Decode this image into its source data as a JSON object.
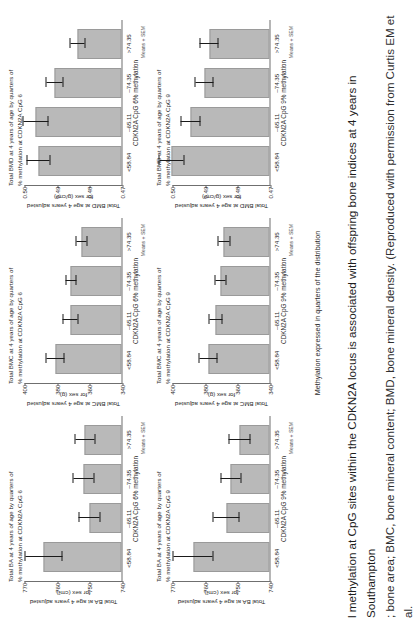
{
  "figure": {
    "common_x_axis_label": "Methylation expressed in quarters of the distribution",
    "caption_line1": "l methylation at CpG sites within the CDKN2A locus is associated with offspring bone indices at 4 years in Southampton",
    "caption_line2": "; bone area; BMC, bone mineral content; BMD, bone mineral density. (Reproduced with permission from Curtis EM et al."
  },
  "categories": [
    "<58.84",
    "–65.11",
    "–74.35",
    ">74.35"
  ],
  "series_note": "Means + SEM",
  "chart_data": [
    {
      "id": "ba-cpg6",
      "type": "bar",
      "title": "Total BA at 4 years of age by quarters of % methylation at CDKN2A CpG 6",
      "title_line1": "Total BA at 4 years of age by quarters of",
      "title_line2": "% methylation at CDKN2A CpG 6",
      "ylabel": "Total BA at age 4 years adjusted for sex (cm²)",
      "ylabel_line1": "Total BA at age 4 years adjusted",
      "ylabel_line2": "for sex (cm²)",
      "xlabel": "CDKN2A CpG 6% methylation",
      "categories": [
        "<58.84",
        "–65.11",
        "–74.35",
        ">74.35"
      ],
      "values": [
        763.8,
        749.9,
        751.6,
        751.2
      ],
      "errors": [
        5.6,
        3.2,
        3.1,
        3.0
      ],
      "ylim": [
        740,
        770
      ],
      "yticks": [
        740,
        750,
        760,
        770
      ],
      "ytick_labels": [
        "740",
        "750",
        "760",
        "770"
      ],
      "grid": false
    },
    {
      "id": "bmc-cpg6",
      "type": "bar",
      "title": "Total BMC at 4 years of age by quarters of % methylation at CDKN2A CpG 6",
      "title_line1": "Total BMC at 4 years of age by quarters of",
      "title_line2": "% methylation at CDKN2A CpG 6",
      "ylabel": "Total BMC at age 4 years adjusted for sex (g)",
      "ylabel_line1": "Total BMC at age 4 years adjusted",
      "ylabel_line2": "for sex (g)",
      "xlabel": "CDKN2A CpG 6% methylation",
      "categories": [
        "<58.84",
        "–65.11",
        "–74.35",
        ">74.35"
      ],
      "values": [
        380.5,
        371.5,
        371.0,
        364.5
      ],
      "errors": [
        5.5,
        4.5,
        3.2,
        3.2
      ],
      "ylim": [
        340,
        400
      ],
      "yticks": [
        340,
        360,
        380,
        400
      ],
      "ytick_labels": [
        "340",
        "360",
        "380",
        "400"
      ],
      "grid": false
    },
    {
      "id": "bmd-cpg6",
      "type": "bar",
      "title": "Total BMD at 4 years of age by quarters of % methylation at CDKN2A CpG 6",
      "title_line1": "Total BMD at 4 years of age by quarters of",
      "title_line2": "% methylation at CDKN2A CpG 6",
      "ylabel": "Total BMD at age 4 years adjusted for sex (g/cm²)",
      "ylabel_line1": "Total BMD at age 4 years adjusted",
      "ylabel_line2": "for sex (g/cm²)",
      "xlabel": "CDKN2A CpG 6% methylation",
      "categories": [
        "<58.84",
        "–65.11",
        "–74.35",
        ">74.35"
      ],
      "values": [
        0.4955,
        0.4962,
        0.4905,
        0.4835
      ],
      "errors": [
        0.0035,
        0.0038,
        0.0025,
        0.0022
      ],
      "ylim": [
        0.47,
        0.5
      ],
      "yticks": [
        0.47,
        0.48,
        0.49,
        0.5
      ],
      "ytick_labels": [
        "0.47",
        "0.48",
        "0.49",
        "0.50"
      ],
      "grid": false
    },
    {
      "id": "ba-cpg9",
      "type": "bar",
      "title": "Total BA at 4 years of age by quarters of % methylation at CDKN2A CpG 9",
      "title_line1": "Total BA at 4 years of age by quarters of",
      "title_line2": "% methylation at CDKN2A CpG 9",
      "ylabel": "Total BA at age 4 years adjusted for sex (cm²)",
      "ylabel_line1": "Total BA at age 4 years adjusted",
      "ylabel_line2": "for sex (cm²)",
      "xlabel": "CDKN2A CpG 9% methylation",
      "categories": [
        "<58.84",
        "–65.11",
        "–74.35",
        ">74.35"
      ],
      "values": [
        763.4,
        753.3,
        751.9,
        749.2
      ],
      "errors": [
        6.0,
        4.0,
        3.0,
        3.3
      ],
      "ylim": [
        740,
        770
      ],
      "yticks": [
        740,
        750,
        760,
        770
      ],
      "ytick_labels": [
        "740",
        "750",
        "760",
        "770"
      ],
      "grid": false
    },
    {
      "id": "bmc-cpg9",
      "type": "bar",
      "title": "Total BMC at 4 years of age by quarters of % methylation at CDKN2A CpG 9",
      "title_line1": "Total BMC at 4 years of age by quarters of",
      "title_line2": "% methylation at CDKN2A CpG 9",
      "ylabel": "Total BMC at age 4 years adjusted for sex (g)",
      "ylabel_line1": "Total BMC at age 4 years adjusted",
      "ylabel_line2": "for sex (g)",
      "xlabel": "CDKN2A CpG 9% methylation",
      "categories": [
        "<58.84",
        "–65.11",
        "–74.35",
        ">74.35"
      ],
      "values": [
        377.5,
        373.0,
        370.0,
        368.0
      ],
      "errors": [
        5.5,
        4.0,
        3.2,
        3.5
      ],
      "ylim": [
        340,
        400
      ],
      "yticks": [
        340,
        360,
        380,
        400
      ],
      "ytick_labels": [
        "340",
        "360",
        "380",
        "400"
      ],
      "grid": false
    },
    {
      "id": "bmd-cpg9",
      "type": "bar",
      "title": "Total BMD at 4 years of age by quarters of % methylation at CDKN2A CpG 9",
      "title_line1": "Total BMD at 4 years of age by quarters of",
      "title_line2": "% methylation at CDKN2A CpG 9",
      "ylabel": "Total BMD at age 4 years adjusted for sex (g/cm²)",
      "ylabel_line1": "Total BMD at age 4 years adjusted",
      "ylabel_line2": "for sex (g/cm²)",
      "xlabel": "CDKN2A CpG 9% methylation",
      "categories": [
        "<58.84",
        "–65.11",
        "–74.35",
        ">74.35"
      ],
      "values": [
        0.5005,
        0.4942,
        0.49,
        0.4885
      ],
      "errors": [
        0.0038,
        0.003,
        0.0028,
        0.0028
      ],
      "ylim": [
        0.47,
        0.5
      ],
      "yticks": [
        0.47,
        0.48,
        0.49,
        0.5
      ],
      "ytick_labels": [
        "0.47",
        "0.48",
        "0.49",
        "0.50"
      ],
      "grid": false
    }
  ],
  "colors": {
    "bar_fill": "#b9b9b9",
    "bar_stroke": "#9a9a9a",
    "error_bar": "#1a1a1a",
    "axis": "#6f6f6f",
    "text": "#2b2b2b"
  }
}
